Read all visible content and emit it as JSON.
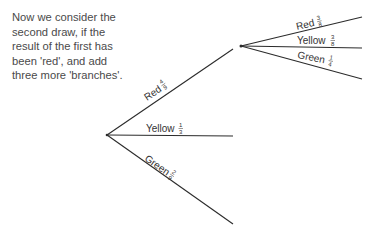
{
  "intro_text": {
    "lines": [
      "Now we consider the",
      "second draw, if the",
      "result of the first has",
      "been 'red', and add",
      "three more 'branches'."
    ]
  },
  "tree": {
    "first_draw": [
      {
        "label": "Red",
        "num": "4",
        "den": "9"
      },
      {
        "label": "Yellow",
        "num": "1",
        "den": "3"
      },
      {
        "label": "Green",
        "num": "2",
        "den": "9"
      }
    ],
    "second_draw_after_red": [
      {
        "label": "Red",
        "num": "3",
        "den": "8"
      },
      {
        "label": "Yellow",
        "num": "3",
        "den": "8"
      },
      {
        "label": "Green",
        "num": "1",
        "den": "4"
      }
    ]
  }
}
